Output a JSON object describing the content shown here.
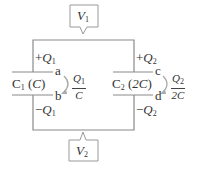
{
  "callouts": {
    "top": {
      "symbol": "V",
      "subscript": "1"
    },
    "bottom": {
      "symbol": "V",
      "subscript": "2"
    }
  },
  "capacitors": [
    {
      "name": "C",
      "index": "1",
      "value": "C",
      "top_charge": {
        "sign": "+",
        "symbol": "Q",
        "subscript": "1"
      },
      "bottom_charge": {
        "sign": "−",
        "symbol": "Q",
        "subscript": "1"
      },
      "top_node": "a",
      "bottom_node": "b",
      "voltage": {
        "numerator": "Q",
        "num_sub": "1",
        "denominator": "C"
      }
    },
    {
      "name": "C",
      "index": "2",
      "value": "2C",
      "top_charge": {
        "sign": "+",
        "symbol": "Q",
        "subscript": "2"
      },
      "bottom_charge": {
        "sign": "−",
        "symbol": "Q",
        "subscript": "2"
      },
      "top_node": "c",
      "bottom_node": "d",
      "voltage": {
        "numerator": "Q",
        "num_sub": "2",
        "denominator": "2C"
      }
    }
  ],
  "colors": {
    "wire": "#888888",
    "text": "#333333",
    "arrow": "#aaaaaa"
  }
}
